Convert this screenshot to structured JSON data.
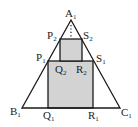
{
  "diagram": {
    "type": "geometry",
    "colors": {
      "stroke": "#1a1a1a",
      "square_fill": "#d3d3d3",
      "background": "#ffffff"
    },
    "labels": {
      "A1": {
        "base": "A",
        "sub": "1"
      },
      "B1": {
        "base": "B",
        "sub": "1"
      },
      "C1": {
        "base": "C",
        "sub": "1"
      },
      "P1": {
        "base": "P",
        "sub": "1"
      },
      "S1": {
        "base": "S",
        "sub": "1"
      },
      "Q1": {
        "base": "Q",
        "sub": "1"
      },
      "R1": {
        "base": "R",
        "sub": "1"
      },
      "P2": {
        "base": "P",
        "sub": "2"
      },
      "S2": {
        "base": "S",
        "sub": "2"
      },
      "Q2": {
        "base": "Q",
        "sub": "2"
      },
      "R2": {
        "base": "R",
        "sub": "2"
      }
    },
    "shapes": {
      "triangle": [
        "A1",
        "B1",
        "C1"
      ],
      "square_large": [
        "P1",
        "Q1",
        "R1",
        "S1"
      ],
      "square_small": [
        "P2",
        "Q2",
        "R2",
        "S2"
      ],
      "dotted_segment": "from A1 down to the top of the small square"
    }
  }
}
